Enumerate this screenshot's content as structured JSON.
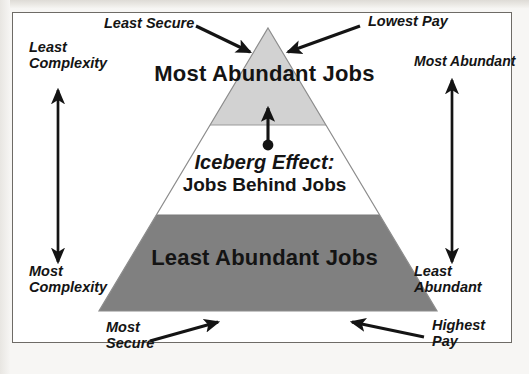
{
  "diagram": {
    "title_center_top": "Most Abundant Jobs",
    "title_center_bottom": "Least Abundant Jobs",
    "callout_emphasis": "Iceberg Effect:",
    "callout_subtitle": "Jobs Behind Jobs",
    "labels": {
      "top_left": "Least Secure",
      "top_right": "Lowest Pay",
      "left_top": "Least\nComplexity",
      "left_bottom": "Most\nComplexity",
      "right_top": "Most Abundant",
      "right_bottom": "Least\nAbundant",
      "bottom_left": "Most\nSecure",
      "bottom_right": "Highest\nPay"
    },
    "colors": {
      "apex_band": "#d2d2d2",
      "middle_band": "#ffffff",
      "base_band": "#808080",
      "outline": "#8c8c8c",
      "ink": "#141414",
      "frame_border": "#6e6b66",
      "page": "#ffffff"
    }
  }
}
